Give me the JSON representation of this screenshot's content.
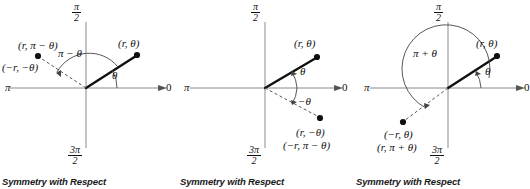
{
  "figure": {
    "background": "#ffffff",
    "ink": "#111111",
    "panel_count": 3
  },
  "axes": {
    "top_label_numerator": "π",
    "top_label_denominator": "2",
    "bottom_label_numerator": "3π",
    "bottom_label_denominator": "2",
    "left_label": "π",
    "right_label": "0"
  },
  "panels": [
    {
      "id": "panel-1",
      "caption": "Symmetry with Respect",
      "point_primary": "(r, θ)",
      "point_image_line_1": "(r, π − θ)",
      "point_image_line_2": "(−r, −θ)",
      "angle_primary": "θ",
      "angle_secondary": "π − θ",
      "axis_top_num": "π",
      "axis_top_den": "2",
      "axis_bottom_num": "3π",
      "axis_bottom_den": "2",
      "axis_left": "π",
      "axis_right": "0"
    },
    {
      "id": "panel-2",
      "caption": "Symmetry with Respect",
      "point_primary": "(r, θ)",
      "point_image_line_1": "(r, −θ)",
      "point_image_line_2": "(−r, π − θ)",
      "angle_primary": "θ",
      "angle_secondary": "−θ",
      "axis_top_num": "π",
      "axis_top_den": "2",
      "axis_bottom_num": "3π",
      "axis_bottom_den": "2",
      "axis_left": "π",
      "axis_right": "0"
    },
    {
      "id": "panel-3",
      "caption": "Symmetry with Respect",
      "point_primary": "(r, θ)",
      "point_image_line_1": "(−r, θ)",
      "point_image_line_2": "(r, π + θ)",
      "angle_primary": "θ",
      "angle_secondary": "π + θ",
      "axis_top_num": "π",
      "axis_top_den": "2",
      "axis_bottom_num": "3π",
      "axis_bottom_den": "2",
      "axis_left": "π",
      "axis_right": "0"
    }
  ]
}
